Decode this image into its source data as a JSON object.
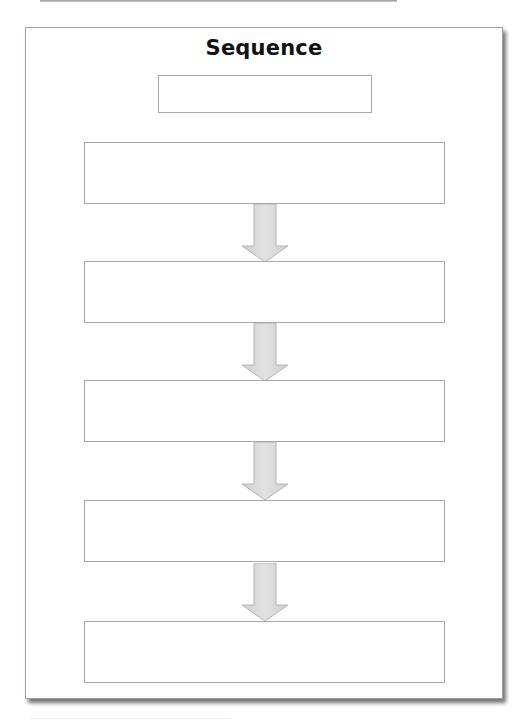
{
  "worksheet": {
    "title": "Sequence",
    "title_box": {
      "value": ""
    },
    "steps": [
      {
        "value": ""
      },
      {
        "value": ""
      },
      {
        "value": ""
      },
      {
        "value": ""
      },
      {
        "value": ""
      }
    ],
    "arrow_count": 4,
    "colors": {
      "border": "#a8a8a8",
      "arrow_fill": "#d6d6d6",
      "arrow_stroke": "#b5b5b5",
      "title_text": "#111111"
    }
  }
}
